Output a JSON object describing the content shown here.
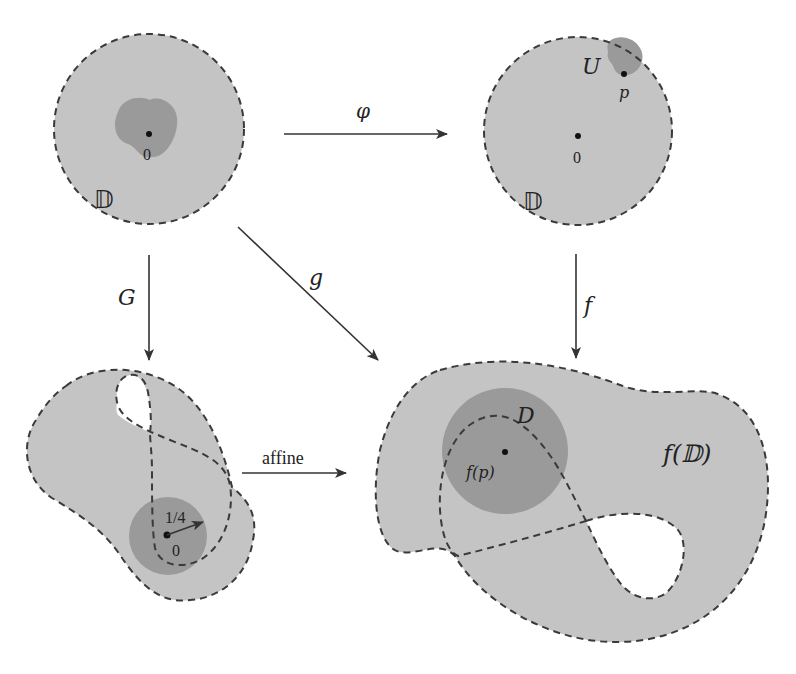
{
  "diagram": {
    "type": "commutative-diagram",
    "colors": {
      "background": "#ffffff",
      "region_light": "#c4c4c4",
      "region_dark": "#9a9a9a",
      "outline": "#3a3a3a",
      "arrow": "#333333"
    },
    "nodes": {
      "top_left": {
        "disk_label": "𝔻",
        "origin_label": "0"
      },
      "top_right": {
        "disk_label": "𝔻",
        "origin_label": "0",
        "neighborhood_label": "U",
        "point_label": "p"
      },
      "bottom_left": {
        "origin_label": "0",
        "radius_label": "1/4"
      },
      "bottom_right": {
        "image_label": "f(𝔻)",
        "disk_label": "D",
        "point_label": "f(p)"
      }
    },
    "arrows": {
      "phi": {
        "label": "φ",
        "from": "top_left",
        "to": "top_right"
      },
      "G": {
        "label": "G",
        "from": "top_left",
        "to": "bottom_left"
      },
      "g": {
        "label": "g",
        "from": "top_left",
        "to": "bottom_right"
      },
      "f": {
        "label": "f",
        "from": "top_right",
        "to": "bottom_right"
      },
      "affine": {
        "label": "affine",
        "from": "bottom_left",
        "to": "bottom_right"
      }
    }
  }
}
